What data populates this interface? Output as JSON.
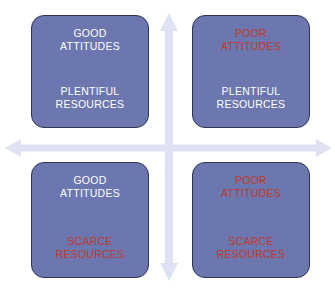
{
  "diagram": {
    "type": "two-by-two-matrix",
    "colors": {
      "box_fill": "#6B77AE",
      "box_border": "#2E3550",
      "arrow": "#DFE2F2",
      "text_positive": "#FFFFFF",
      "text_negative": "#C0392B",
      "background": "#FFFFFF"
    },
    "axes": {
      "horizontal": {
        "icon": "double-headed-horizontal-arrow",
        "label": ""
      },
      "vertical": {
        "icon": "double-headed-vertical-arrow",
        "label": ""
      }
    },
    "quadrants": [
      {
        "position": "top-left",
        "attitudes": "GOOD\nATTITUDES",
        "attitudes_tone": "positive",
        "resources": "PLENTIFUL\nRESOURCES",
        "resources_tone": "positive"
      },
      {
        "position": "top-right",
        "attitudes": "POOR\nATTITUDES",
        "attitudes_tone": "negative",
        "resources": "PLENTIFUL\nRESOURCES",
        "resources_tone": "positive"
      },
      {
        "position": "bottom-left",
        "attitudes": "GOOD\nATTITUDES",
        "attitudes_tone": "positive",
        "resources": "SCARCE\nRESOURCES",
        "resources_tone": "negative"
      },
      {
        "position": "bottom-right",
        "attitudes": "POOR\nATTITUDES",
        "attitudes_tone": "negative",
        "resources": "SCARCE\nRESOURCES",
        "resources_tone": "negative"
      }
    ]
  }
}
